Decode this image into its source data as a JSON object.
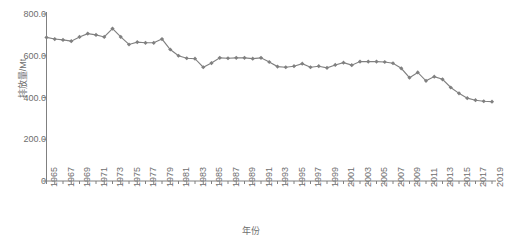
{
  "chart_data": {
    "type": "line",
    "title": "",
    "xlabel": "年份",
    "ylabel": "排放量/Mt",
    "ylim": [
      0,
      800
    ],
    "yticks": [
      0,
      200,
      400,
      600,
      800
    ],
    "ytick_labels": [
      "0",
      "200.0",
      "400.0",
      "600.0",
      "800.0"
    ],
    "grid": false,
    "legend": null,
    "marker": "diamond",
    "series_color": "#808080",
    "axis_color": "#808080",
    "text_color": "#6e6e6e",
    "xtick_step": 2,
    "xtick_labels": [
      "1965",
      "1967",
      "1969",
      "1971",
      "1973",
      "1975",
      "1977",
      "1979",
      "1981",
      "1983",
      "1985",
      "1987",
      "1989",
      "1991",
      "1993",
      "1995",
      "1997",
      "1999",
      "2001",
      "2003",
      "2005",
      "2007",
      "2009",
      "2011",
      "2013",
      "2015",
      "2017",
      "2019"
    ],
    "x": [
      1965,
      1966,
      1967,
      1968,
      1969,
      1970,
      1971,
      1972,
      1973,
      1974,
      1975,
      1976,
      1977,
      1978,
      1979,
      1980,
      1981,
      1982,
      1983,
      1984,
      1985,
      1986,
      1987,
      1988,
      1989,
      1990,
      1991,
      1992,
      1993,
      1994,
      1995,
      1996,
      1997,
      1998,
      1999,
      2000,
      2001,
      2002,
      2003,
      2004,
      2005,
      2006,
      2007,
      2008,
      2009,
      2010,
      2011,
      2012,
      2013,
      2014,
      2015,
      2016,
      2017,
      2018,
      2019
    ],
    "values": [
      688,
      680,
      676,
      670,
      690,
      706,
      700,
      690,
      730,
      690,
      654,
      665,
      662,
      662,
      680,
      630,
      600,
      588,
      586,
      545,
      565,
      590,
      588,
      590,
      590,
      586,
      590,
      570,
      548,
      545,
      550,
      562,
      545,
      550,
      542,
      556,
      567,
      555,
      572,
      572,
      572,
      570,
      564,
      540,
      495,
      520,
      480,
      500,
      487,
      448,
      420,
      397,
      387,
      382,
      380
    ],
    "series": [
      {
        "name": "排放量",
        "values": [
          688,
          680,
          676,
          670,
          690,
          706,
          700,
          690,
          730,
          690,
          654,
          665,
          662,
          662,
          680,
          630,
          600,
          588,
          586,
          545,
          565,
          590,
          588,
          590,
          590,
          586,
          590,
          570,
          548,
          545,
          550,
          562,
          545,
          550,
          542,
          556,
          567,
          555,
          572,
          572,
          572,
          570,
          564,
          540,
          495,
          520,
          480,
          500,
          487,
          448,
          420,
          397,
          387,
          382,
          380
        ]
      }
    ]
  }
}
